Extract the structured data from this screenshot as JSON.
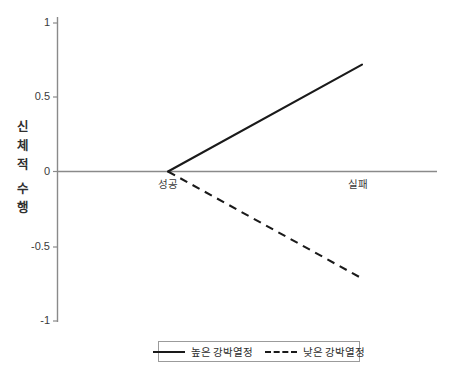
{
  "chart_data": {
    "type": "line",
    "title": "",
    "xlabel": "",
    "ylabel": "신체적 수행",
    "ylabel_lines": [
      "신체적",
      "수행"
    ],
    "categories": [
      "성공",
      "실패"
    ],
    "x": [
      0,
      1
    ],
    "ylim": [
      -1,
      1
    ],
    "xlim": [
      -0.65,
      1.02
    ],
    "yticks": [
      1,
      0.5,
      0,
      -0.5,
      -1
    ],
    "ytick_labels": [
      "1",
      "0.5",
      "0",
      "-0.5",
      "-1"
    ],
    "grid": false,
    "legend_position": "bottom-center",
    "series": [
      {
        "name": "높은 강박열정",
        "style": "solid",
        "color": "#1a1a1a",
        "values": [
          0,
          0.72
        ]
      },
      {
        "name": "낮은 강박열정",
        "style": "dashed",
        "color": "#1a1a1a",
        "values": [
          0,
          -0.72
        ]
      }
    ],
    "axis_color": "#8a8a8a",
    "background": "#ffffff"
  },
  "legend": {
    "entries": [
      {
        "label": "높은 강박열정",
        "style": "solid"
      },
      {
        "label": "낮은 강박열정",
        "style": "dashed"
      }
    ]
  },
  "axes": {
    "ytick_1": "1",
    "ytick_05": "0.5",
    "ytick_0": "0",
    "ytick_m05": "-0.5",
    "ytick_m1": "-1",
    "cat_success": "성공",
    "cat_failure": "실패",
    "ylabel_word1_ch1": "신",
    "ylabel_word1_ch2": "체",
    "ylabel_word1_ch3": "적",
    "ylabel_word2_ch1": "수",
    "ylabel_word2_ch2": "행"
  }
}
